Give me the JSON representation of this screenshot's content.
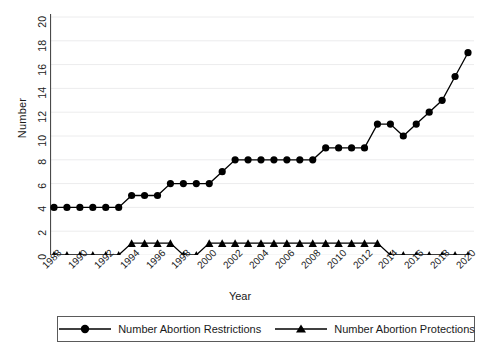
{
  "chart_data": {
    "type": "line",
    "title": "",
    "xlabel": "Year",
    "ylabel": "Number",
    "grid": "horizontal-light",
    "legend_position": "bottom",
    "xlim": [
      1988,
      2020
    ],
    "ylim": [
      0,
      20
    ],
    "ytick_step": 2,
    "xtick_step": 2,
    "x": [
      1988,
      1989,
      1990,
      1991,
      1992,
      1993,
      1994,
      1995,
      1996,
      1997,
      1998,
      1999,
      2000,
      2001,
      2002,
      2003,
      2004,
      2005,
      2006,
      2007,
      2008,
      2009,
      2010,
      2011,
      2012,
      2013,
      2014,
      2015,
      2016,
      2017,
      2018,
      2019,
      2020
    ],
    "xtick_labels": [
      "1988",
      "1990",
      "1992",
      "1994",
      "1996",
      "1998",
      "2000",
      "2002",
      "2004",
      "2006",
      "2008",
      "2010",
      "2012",
      "2014",
      "2016",
      "2018",
      "2020"
    ],
    "ytick_labels": [
      "0",
      "2",
      "4",
      "6",
      "8",
      "10",
      "12",
      "14",
      "16",
      "18",
      "20"
    ],
    "series": [
      {
        "name": "Number Abortion Restrictions",
        "marker": "circle",
        "color": "#000000",
        "values": [
          4,
          4,
          4,
          4,
          4,
          4,
          5,
          5,
          5,
          6,
          6,
          6,
          6,
          7,
          8,
          8,
          8,
          8,
          8,
          8,
          8,
          9,
          9,
          9,
          9,
          11,
          11,
          10,
          11,
          12,
          13,
          15,
          17
        ]
      },
      {
        "name": "Number Abortion Protections",
        "marker": "triangle",
        "color": "#000000",
        "values": [
          0,
          0,
          0,
          0,
          0,
          0,
          1,
          1,
          1,
          1,
          0,
          0,
          1,
          1,
          1,
          1,
          1,
          1,
          1,
          1,
          1,
          1,
          1,
          1,
          1,
          1,
          0,
          0,
          0,
          0,
          0,
          0,
          0
        ]
      }
    ]
  },
  "legend": {
    "items": [
      {
        "label": "Number Abortion Restrictions",
        "marker": "circle-marker-icon"
      },
      {
        "label": "Number Abortion Protections",
        "marker": "triangle-marker-icon"
      }
    ]
  }
}
